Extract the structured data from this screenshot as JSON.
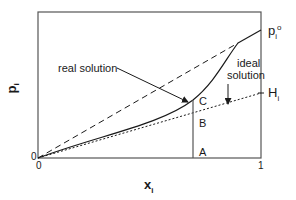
{
  "diagram": {
    "title": "",
    "y_axis_label": {
      "base": "p",
      "sub": "i"
    },
    "x_axis_label": {
      "base": "x",
      "sub": "i"
    },
    "x_ticks": [
      "0",
      "1"
    ],
    "y_ticks": [
      "0"
    ],
    "right_labels": {
      "pure_pressure": {
        "base": "p",
        "sub": "i",
        "sup": "o"
      },
      "henry": {
        "base": "H",
        "sub": "i"
      }
    },
    "annotations": {
      "real_solution": "real solution",
      "ideal_solution_line1": "ideal",
      "ideal_solution_line2": "solution",
      "point_c": "C",
      "point_b": "B",
      "point_a": "A"
    },
    "curves": [
      {
        "name": "ideal solution (Raoult's law)",
        "style": "dashed"
      },
      {
        "name": "real solution",
        "style": "solid"
      },
      {
        "name": "Henry's law",
        "style": "dotted"
      }
    ],
    "line_color": "#1a1a1a",
    "frame_color": "#555555"
  }
}
